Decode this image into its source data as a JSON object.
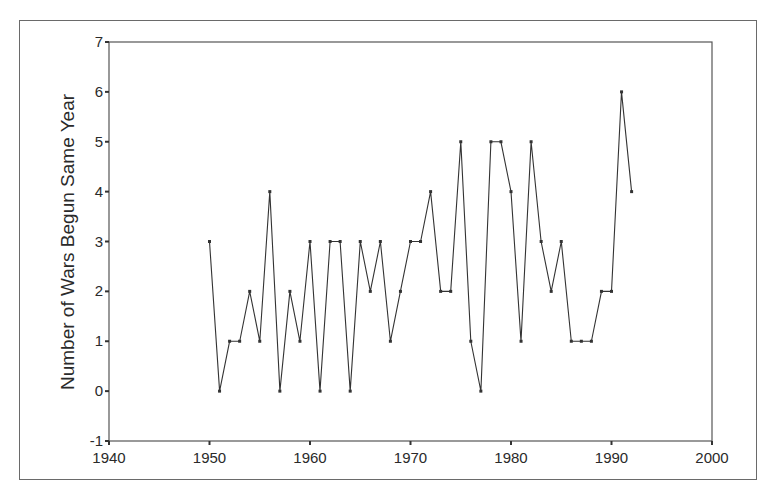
{
  "chart_data": {
    "type": "line",
    "title": "",
    "xlabel": "",
    "ylabel": "Number of Wars Begun Same Year",
    "xlim": [
      1940,
      2000
    ],
    "ylim": [
      -1,
      7
    ],
    "x_ticks": [
      "1940",
      "1950",
      "1960",
      "1970",
      "1980",
      "1990",
      "2000"
    ],
    "y_ticks": [
      "-1",
      "0",
      "1",
      "2",
      "3",
      "4",
      "5",
      "6",
      "7"
    ],
    "grid": false,
    "legend": null,
    "markers": true,
    "x": [
      1950,
      1951,
      1952,
      1953,
      1954,
      1955,
      1956,
      1957,
      1958,
      1959,
      1960,
      1961,
      1962,
      1963,
      1964,
      1965,
      1966,
      1967,
      1968,
      1969,
      1970,
      1971,
      1972,
      1973,
      1974,
      1975,
      1976,
      1977,
      1978,
      1979,
      1980,
      1981,
      1982,
      1983,
      1984,
      1985,
      1986,
      1987,
      1988,
      1989,
      1990,
      1991,
      1992
    ],
    "series": [
      {
        "name": "Wars begun",
        "color": "#333333",
        "values": [
          3,
          0,
          1,
          1,
          2,
          1,
          4,
          0,
          2,
          1,
          3,
          0,
          3,
          3,
          0,
          3,
          2,
          3,
          1,
          2,
          3,
          3,
          4,
          2,
          2,
          5,
          1,
          0,
          5,
          5,
          4,
          1,
          5,
          3,
          2,
          3,
          1,
          1,
          1,
          2,
          2,
          6,
          4
        ]
      }
    ]
  }
}
